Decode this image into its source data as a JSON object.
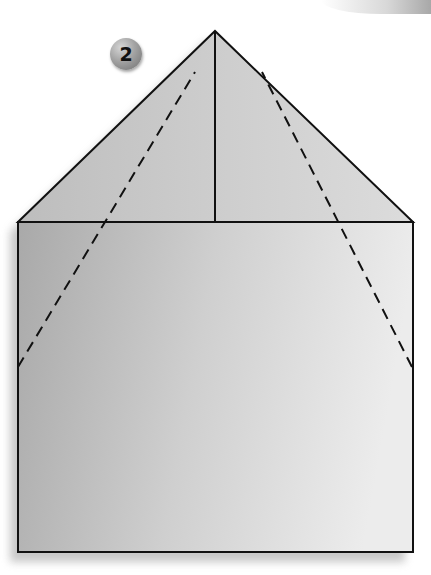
{
  "diagram": {
    "type": "origami-fold-step",
    "step_number": "2",
    "colors": {
      "paper_light": "#e6e6e6",
      "paper_dark": "#a9a9a9",
      "outline": "#111111",
      "shadow": "#bdbdbd",
      "badge": "#9a9a9a"
    },
    "shapes": {
      "apex": [
        215,
        31
      ],
      "left_corner": [
        18,
        222
      ],
      "right_corner": [
        413,
        222
      ],
      "rectangle": {
        "x": 18,
        "y": 222,
        "width": 395,
        "height": 330
      },
      "center_crease": {
        "from": [
          215,
          31
        ],
        "to": [
          215,
          222
        ]
      },
      "left_fold_line": {
        "from": [
          18,
          367
        ],
        "to": [
          195,
          72
        ],
        "style": "dashed"
      },
      "right_fold_line": {
        "from": [
          412,
          367
        ],
        "to": [
          262,
          72
        ],
        "style": "dashed"
      }
    }
  }
}
